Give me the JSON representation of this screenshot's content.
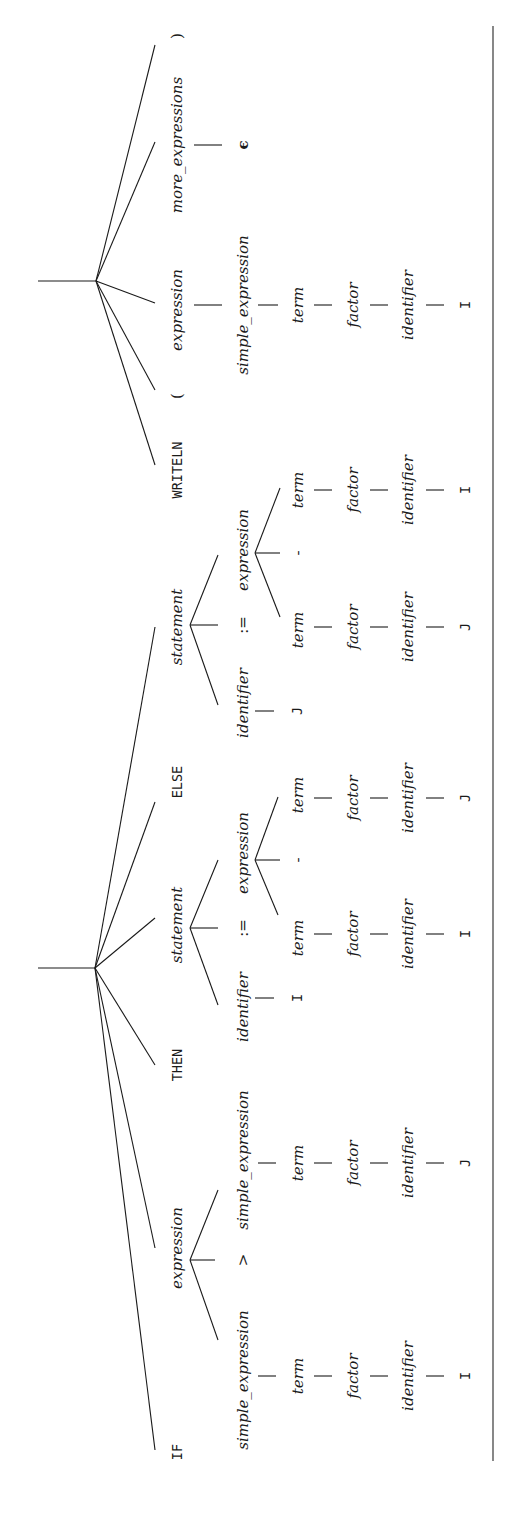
{
  "diagram": {
    "type": "parse-tree",
    "orientation": "rotated-90-ccw",
    "tree1": {
      "children_of_root": [
        "IF",
        "expression",
        "THEN",
        "statement",
        "ELSE",
        "statement"
      ],
      "if_kw": "IF",
      "then_kw": "THEN",
      "else_kw": "ELSE",
      "cond": {
        "label": "expression",
        "left": {
          "label": "simple_expression",
          "chain": [
            "term",
            "factor",
            "identifier"
          ],
          "leaf": "I"
        },
        "op": ">",
        "right": {
          "label": "simple_expression",
          "chain": [
            "term",
            "factor",
            "identifier"
          ],
          "leaf": "J"
        }
      },
      "then_stmt": {
        "label": "statement",
        "target": {
          "label": "identifier",
          "leaf": "I"
        },
        "assign": ":=",
        "expr": {
          "label": "expression",
          "left": {
            "chain": [
              "term",
              "factor",
              "identifier"
            ],
            "leaf": "I"
          },
          "op": "-",
          "right": {
            "chain": [
              "term",
              "factor",
              "identifier"
            ],
            "leaf": "J"
          }
        }
      },
      "else_stmt": {
        "label": "statement",
        "target": {
          "label": "identifier",
          "leaf": "J"
        },
        "assign": ":=",
        "expr": {
          "label": "expression",
          "left": {
            "chain": [
              "term",
              "factor",
              "identifier"
            ],
            "leaf": "J"
          },
          "op": "-",
          "right": {
            "chain": [
              "term",
              "factor",
              "identifier"
            ],
            "leaf": "I"
          }
        }
      }
    },
    "tree2": {
      "writeln_kw": "WRITELN",
      "lparen": "(",
      "expr": {
        "label": "expression",
        "chain": [
          "simple_expression",
          "term",
          "factor",
          "identifier"
        ],
        "leaf": "I"
      },
      "more": {
        "label": "more_expressions",
        "leaf": "ϵ"
      },
      "rparen": ")"
    }
  }
}
